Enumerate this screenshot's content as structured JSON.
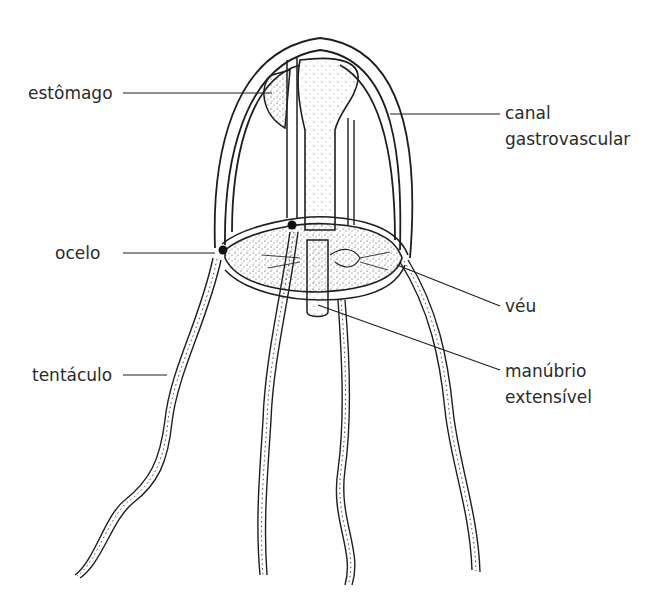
{
  "diagram": {
    "labels": {
      "stomach": "estômago",
      "ocellus": "ocelo",
      "tentacle": "tentáculo",
      "canal_line1": "canal",
      "canal_line2": "gastrovascular",
      "velum": "véu",
      "manubrium_line1": "manúbrio",
      "manubrium_line2": "extensível"
    },
    "colors": {
      "ink": "#1e1e1e",
      "text": "#2a2a2a",
      "background": "#ffffff",
      "ocellus_dot": "#111111"
    }
  }
}
